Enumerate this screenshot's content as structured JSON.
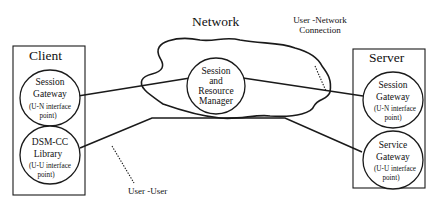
{
  "diagram": {
    "network": {
      "title": "Network"
    },
    "client": {
      "title": "Client",
      "nodes": [
        {
          "line1": "Session",
          "line2": "Gateway",
          "note1": "(U-N interface",
          "note2": "point)"
        },
        {
          "line1": "DSM-CC",
          "line2": "Library",
          "note1": "(U-U interface",
          "note2": "point)"
        }
      ]
    },
    "server": {
      "title": "Server",
      "nodes": [
        {
          "line1": "Session",
          "line2": "Gateway",
          "note1": "(U-N interface",
          "note2": "point)"
        },
        {
          "line1": "Service",
          "line2": "Gateway",
          "note1": "(U-U interface",
          "note2": "point)"
        }
      ]
    },
    "srm": {
      "line1": "Session",
      "line2": "and",
      "line3": "Resource",
      "line4": "Manager"
    },
    "annotations": {
      "user_network_1": "User -Network",
      "user_network_2": "Connection",
      "user_user": "User -User"
    },
    "colors": {
      "ink": "#1a1a1a",
      "background": "#ffffff"
    }
  }
}
